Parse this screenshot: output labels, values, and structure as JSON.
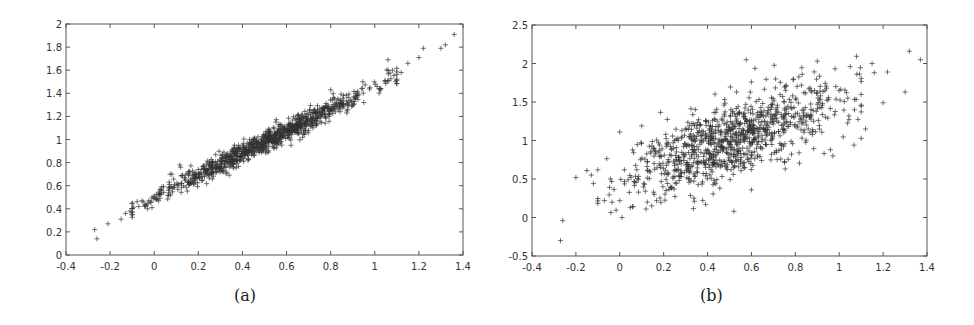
{
  "chart_data": [
    {
      "id": "a",
      "type": "scatter",
      "title": "",
      "caption": "(a)",
      "xlabel": "",
      "ylabel": "",
      "marker": "+",
      "marker_color": "#333333",
      "xlim": [
        -0.4,
        1.4
      ],
      "ylim": [
        0,
        2
      ],
      "xticks": [
        "-0.4",
        "-0.2",
        "0",
        "0.2",
        "0.4",
        "0.6",
        "0.8",
        "1",
        "1.2",
        "1.4"
      ],
      "yticks": [
        "0",
        "0.2",
        "0.4",
        "0.6",
        "0.8",
        "1",
        "1.2",
        "1.4",
        "1.6",
        "1.8",
        "2"
      ],
      "grid": false,
      "legend": null,
      "trend": {
        "slope": 0.96,
        "intercept": 0.5,
        "noise_sd": 0.045
      },
      "cloud": {
        "n": 1000,
        "x_mean": 0.5,
        "x_sd": 0.24,
        "seed": 11
      },
      "points": [
        [
          -0.27,
          0.22
        ],
        [
          -0.26,
          0.14
        ],
        [
          -0.21,
          0.27
        ],
        [
          -0.15,
          0.31
        ],
        [
          -0.13,
          0.36
        ],
        [
          -0.11,
          0.38
        ],
        [
          -0.07,
          0.42
        ],
        [
          -0.05,
          0.46
        ],
        [
          -0.03,
          0.4
        ],
        [
          -0.01,
          0.5
        ],
        [
          0.02,
          0.52
        ],
        [
          0.08,
          0.7
        ],
        [
          0.12,
          0.76
        ],
        [
          0.62,
          0.95
        ],
        [
          0.8,
          1.43
        ],
        [
          0.95,
          1.32
        ],
        [
          1.06,
          1.69
        ],
        [
          1.08,
          1.6
        ],
        [
          1.12,
          1.58
        ],
        [
          1.15,
          1.66
        ],
        [
          1.2,
          1.71
        ],
        [
          1.22,
          1.79
        ],
        [
          1.3,
          1.79
        ],
        [
          1.32,
          1.82
        ],
        [
          1.36,
          1.91
        ]
      ]
    },
    {
      "id": "b",
      "type": "scatter",
      "title": "",
      "caption": "(b)",
      "xlabel": "",
      "ylabel": "",
      "marker": "+",
      "marker_color": "#333333",
      "xlim": [
        -0.4,
        1.4
      ],
      "ylim": [
        -0.5,
        2.5
      ],
      "xticks": [
        "-0.4",
        "-0.2",
        "0",
        "0.2",
        "0.4",
        "0.6",
        "0.8",
        "1",
        "1.2",
        "1.4"
      ],
      "yticks": [
        "-0.5",
        "0",
        "0.5",
        "1",
        "1.5",
        "2",
        "2.5"
      ],
      "grid": false,
      "legend": null,
      "trend": {
        "slope": 1.0,
        "intercept": 0.5,
        "noise_sd": 0.24
      },
      "cloud": {
        "n": 1000,
        "x_mean": 0.5,
        "x_sd": 0.24,
        "seed": 29
      },
      "points": [
        [
          -0.27,
          -0.3
        ],
        [
          -0.26,
          -0.04
        ],
        [
          -0.2,
          0.52
        ],
        [
          -0.15,
          0.61
        ],
        [
          -0.13,
          0.55
        ],
        [
          -0.12,
          0.44
        ],
        [
          -0.1,
          0.62
        ],
        [
          -0.07,
          0.22
        ],
        [
          0.0,
          0.22
        ],
        [
          0.01,
          0.0
        ],
        [
          0.06,
          0.14
        ],
        [
          0.1,
          1.19
        ],
        [
          0.12,
          0.11
        ],
        [
          0.52,
          0.08
        ],
        [
          0.6,
          0.36
        ],
        [
          0.6,
          1.76
        ],
        [
          0.71,
          1.8
        ],
        [
          0.79,
          1.79
        ],
        [
          0.9,
          2.03
        ],
        [
          0.96,
          0.88
        ],
        [
          1.05,
          1.96
        ],
        [
          1.08,
          1.86
        ],
        [
          1.12,
          1.15
        ],
        [
          1.15,
          2.0
        ],
        [
          1.16,
          1.88
        ],
        [
          1.2,
          1.49
        ],
        [
          1.22,
          1.89
        ],
        [
          1.3,
          1.63
        ],
        [
          1.32,
          2.16
        ],
        [
          1.37,
          2.05
        ]
      ]
    }
  ]
}
